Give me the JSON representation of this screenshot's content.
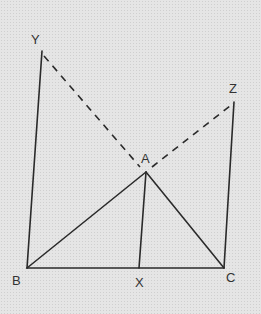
{
  "diagram": {
    "colors": {
      "background": "#e5e5e5",
      "stroke": "#2a2a2a"
    },
    "points": {
      "Y": {
        "label": "Y",
        "x": 42,
        "y": 51,
        "lx": 31,
        "ly": 44
      },
      "Z": {
        "label": "Z",
        "x": 234,
        "y": 102,
        "lx": 229,
        "ly": 93
      },
      "A": {
        "label": "A",
        "x": 146,
        "y": 172,
        "lx": 141,
        "ly": 163
      },
      "B": {
        "label": "B",
        "x": 27,
        "y": 268,
        "lx": 12,
        "ly": 285
      },
      "X": {
        "label": "X",
        "x": 139,
        "y": 268,
        "lx": 135,
        "ly": 287
      },
      "C": {
        "label": "C",
        "x": 224,
        "y": 268,
        "lx": 226,
        "ly": 282
      }
    },
    "solid_segments": [
      "YB",
      "ZC",
      "BA",
      "AC",
      "AX",
      "BC"
    ],
    "dashed_segments": [
      "YA",
      "AZ"
    ]
  }
}
